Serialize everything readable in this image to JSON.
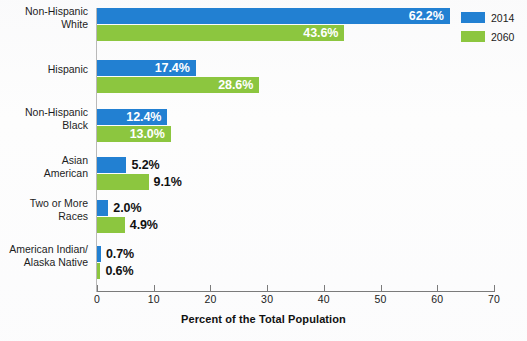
{
  "chart_data": {
    "type": "bar",
    "orientation": "horizontal",
    "title": "",
    "xlabel": "Percent of the Total Population",
    "ylabel": "",
    "xlim": [
      0,
      70
    ],
    "xticks": [
      0,
      10,
      20,
      30,
      40,
      50,
      60,
      70
    ],
    "xtick_labels": [
      "0",
      "10",
      "20",
      "30",
      "40",
      "50",
      "60",
      "70"
    ],
    "grid": false,
    "legend_position": "top-right",
    "categories": [
      "Non-Hispanic White",
      "Hispanic",
      "Non-Hispanic Black",
      "Asian American",
      "Two or More Races",
      "American Indian/ Alaska Native"
    ],
    "category_lines": [
      [
        "Non-Hispanic",
        "White"
      ],
      [
        "Hispanic"
      ],
      [
        "Non-Hispanic",
        "Black"
      ],
      [
        "Asian",
        "American"
      ],
      [
        "Two or More",
        "Races"
      ],
      [
        "American Indian/",
        "Alaska Native"
      ]
    ],
    "series": [
      {
        "name": "2014",
        "color": "#2280d2",
        "values": [
          62.2,
          17.4,
          12.4,
          5.2,
          2.0,
          0.7
        ],
        "labels": [
          "62.2%",
          "17.4%",
          "12.4%",
          "5.2%",
          "2.0%",
          "0.7%"
        ],
        "label_placement": [
          "inside",
          "inside",
          "inside",
          "outside",
          "outside",
          "outside"
        ]
      },
      {
        "name": "2060",
        "color": "#8cc63f",
        "values": [
          43.6,
          28.6,
          13.0,
          9.1,
          4.9,
          0.6
        ],
        "labels": [
          "43.6%",
          "28.6%",
          "13.0%",
          "9.1%",
          "4.9%",
          "0.6%"
        ],
        "label_placement": [
          "inside",
          "inside",
          "inside",
          "outside",
          "outside",
          "outside"
        ]
      }
    ]
  },
  "legend": {
    "items": [
      {
        "label": "2014",
        "color": "#2280d2"
      },
      {
        "label": "2060",
        "color": "#8cc63f"
      }
    ]
  },
  "axis": {
    "title": "Percent of the Total Population"
  }
}
